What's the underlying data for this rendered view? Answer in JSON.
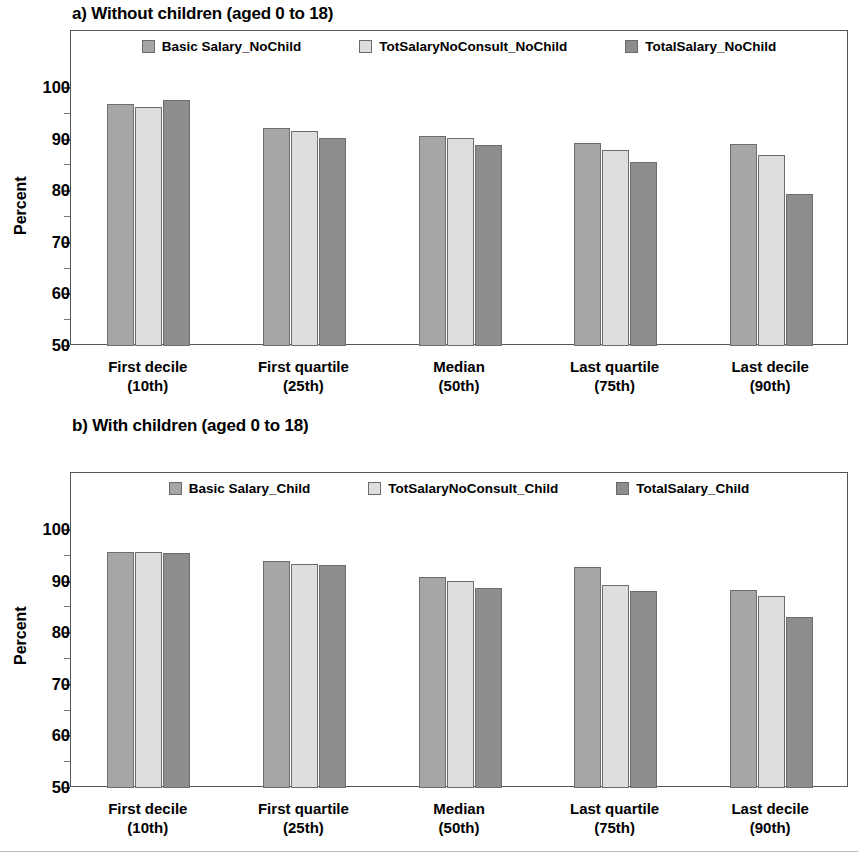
{
  "figure": {
    "panels": [
      {
        "id": "a",
        "title": "a) Without children (aged 0 to 18)",
        "ylabel": "Percent"
      },
      {
        "id": "b",
        "title": "b) With children (aged 0 to 18)",
        "ylabel": "Percent"
      }
    ]
  },
  "chart_data": [
    {
      "type": "bar",
      "title": "a) Without children (aged 0 to 18)",
      "xlabel": "",
      "ylabel": "Percent",
      "ylim": [
        50,
        100
      ],
      "yticks": [
        50,
        60,
        70,
        80,
        90,
        100
      ],
      "ytick_labels": [
        "50",
        "60",
        "70",
        "80",
        "90",
        "100"
      ],
      "minor_ticks": [
        55,
        65,
        75,
        85,
        95
      ],
      "grid": false,
      "legend_position": "top-center-inside",
      "categories": [
        "First decile",
        "First quartile",
        "Median",
        "Last quartile",
        "Last decile"
      ],
      "category_sublabels": [
        "(10th)",
        "(25th)",
        "(50th)",
        "(75th)",
        "(90th)"
      ],
      "series": [
        {
          "name": "Basic Salary_NoChild",
          "color": "#a6a6a6",
          "values": [
            96.9,
            92.3,
            90.7,
            89.3,
            89.2
          ]
        },
        {
          "name": "TotSalaryNoConsult_NoChild",
          "color": "#dedede",
          "values": [
            96.4,
            91.6,
            90.4,
            88.0,
            87.0
          ]
        },
        {
          "name": "TotalSalary_NoChild",
          "color": "#8d8d8d",
          "values": [
            97.6,
            90.3,
            89.0,
            85.6,
            79.5
          ]
        }
      ]
    },
    {
      "type": "bar",
      "title": "b) With children (aged 0 to 18)",
      "xlabel": "",
      "ylabel": "Percent",
      "ylim": [
        50,
        100
      ],
      "yticks": [
        50,
        60,
        70,
        80,
        90,
        100
      ],
      "ytick_labels": [
        "50",
        "60",
        "70",
        "80",
        "90",
        "100"
      ],
      "minor_ticks": [
        55,
        65,
        75,
        85,
        95
      ],
      "grid": false,
      "legend_position": "top-center-inside",
      "categories": [
        "First decile",
        "First quartile",
        "Median",
        "Last quartile",
        "Last decile"
      ],
      "category_sublabels": [
        "(10th)",
        "(25th)",
        "(50th)",
        "(75th)",
        "(90th)"
      ],
      "series": [
        {
          "name": "Basic Salary_Child",
          "color": "#a6a6a6",
          "values": [
            95.7,
            94.0,
            90.9,
            92.8,
            88.3
          ]
        },
        {
          "name": "TotSalaryNoConsult_Child",
          "color": "#dedede",
          "values": [
            95.8,
            93.4,
            90.2,
            89.4,
            87.3
          ]
        },
        {
          "name": "TotalSalary_Child",
          "color": "#8d8d8d",
          "values": [
            95.5,
            93.3,
            88.8,
            88.1,
            83.2
          ]
        }
      ]
    }
  ]
}
